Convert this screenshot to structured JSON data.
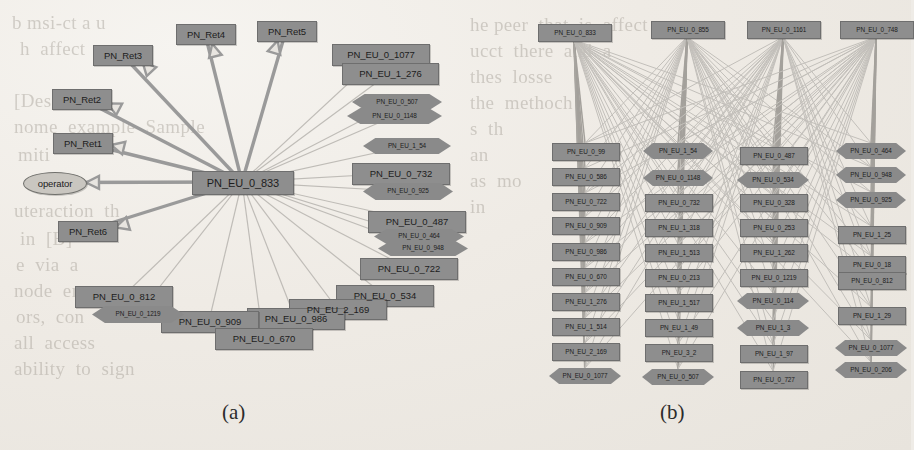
{
  "figure": {
    "type": "two-panel-graph-figure",
    "captions": [
      {
        "id": "cap-a",
        "label": "(a)",
        "x": 222,
        "y": 400
      },
      {
        "id": "cap-b",
        "label": "(b)",
        "x": 660,
        "y": 400
      }
    ]
  },
  "panel_a": {
    "name": "panel-a-star-graph",
    "caption": "(a)",
    "hub": {
      "label": "PN_EU_0_833",
      "shape": "box",
      "x": 192,
      "y": 171,
      "w": 100,
      "h": 22
    },
    "nodes": [
      {
        "label": "PN_Ret4",
        "shape": "box",
        "x": 176,
        "y": 24,
        "w": 58,
        "h": 19,
        "size": "mid"
      },
      {
        "label": "PN_Ret5",
        "shape": "box",
        "x": 257,
        "y": 21,
        "w": 58,
        "h": 19,
        "size": "mid"
      },
      {
        "label": "PN_Ret3",
        "shape": "box",
        "x": 93,
        "y": 45,
        "w": 58,
        "h": 19,
        "size": "mid"
      },
      {
        "label": "PN_Ret2",
        "shape": "box",
        "x": 52,
        "y": 89,
        "w": 58,
        "h": 19,
        "size": "mid"
      },
      {
        "label": "PN_Ret1",
        "shape": "box",
        "x": 53,
        "y": 133,
        "w": 58,
        "h": 19,
        "size": "mid"
      },
      {
        "label": "PN_Ret6",
        "shape": "box",
        "x": 58,
        "y": 221,
        "w": 58,
        "h": 19,
        "size": "mid"
      },
      {
        "label": "operator",
        "shape": "ellipse",
        "x": 23,
        "y": 172,
        "w": 62,
        "h": 21,
        "size": "mid"
      },
      {
        "label": "PN_EU_0_1077",
        "shape": "box-stack",
        "x": 332,
        "y": 44,
        "w": 96,
        "h": 20,
        "size": "mid"
      },
      {
        "label": "PN_EU_1_276",
        "shape": "box",
        "x": 342,
        "y": 63,
        "w": 95,
        "h": 20,
        "size": "mid"
      },
      {
        "label": "PN_EU_0_507",
        "shape": "diamond",
        "x": 352,
        "y": 94,
        "w": 90,
        "h": 16,
        "size": "tiny"
      },
      {
        "label": "PN_EU_0_1148",
        "shape": "diamond",
        "x": 347,
        "y": 108,
        "w": 95,
        "h": 16,
        "size": "tiny"
      },
      {
        "label": "PN_EU_1_54",
        "shape": "diamond",
        "x": 363,
        "y": 138,
        "w": 88,
        "h": 16,
        "size": "tiny"
      },
      {
        "label": "PN_EU_0_732",
        "shape": "box",
        "x": 352,
        "y": 163,
        "w": 96,
        "h": 20,
        "size": "mid"
      },
      {
        "label": "PN_EU_0_925",
        "shape": "diamond",
        "x": 363,
        "y": 183,
        "w": 90,
        "h": 17,
        "size": "tiny"
      },
      {
        "label": "PN_EU_0_487",
        "shape": "box",
        "x": 368,
        "y": 211,
        "w": 96,
        "h": 20,
        "size": "mid"
      },
      {
        "label": "PN_EU_0_464",
        "shape": "diamond",
        "x": 374,
        "y": 229,
        "w": 90,
        "h": 15,
        "size": "tiny"
      },
      {
        "label": "PN_EU_0_948",
        "shape": "diamond",
        "x": 378,
        "y": 241,
        "w": 90,
        "h": 15,
        "size": "tiny"
      },
      {
        "label": "PN_EU_0_722",
        "shape": "box",
        "x": 360,
        "y": 258,
        "w": 96,
        "h": 20,
        "size": "mid"
      },
      {
        "label": "PN_EU_0_534",
        "shape": "box",
        "x": 336,
        "y": 285,
        "w": 96,
        "h": 20,
        "size": "mid"
      },
      {
        "label": "PN_EU_2_169",
        "shape": "box",
        "x": 289,
        "y": 299,
        "w": 96,
        "h": 19,
        "size": "mid"
      },
      {
        "label": "PN_EU_0_986",
        "shape": "box",
        "x": 247,
        "y": 308,
        "w": 96,
        "h": 20,
        "size": "mid"
      },
      {
        "label": "PN_EU_0_909",
        "shape": "box",
        "x": 161,
        "y": 311,
        "w": 96,
        "h": 20,
        "size": "mid"
      },
      {
        "label": "PN_EU_0_670",
        "shape": "box",
        "x": 215,
        "y": 328,
        "w": 96,
        "h": 20,
        "size": "mid"
      },
      {
        "label": "PN_EU_0_812",
        "shape": "box",
        "x": 75,
        "y": 286,
        "w": 96,
        "h": 20,
        "size": "mid"
      },
      {
        "label": "PN_EU_0_1219",
        "shape": "diamond",
        "x": 92,
        "y": 306,
        "w": 92,
        "h": 17,
        "size": "tiny"
      }
    ],
    "edges_note": "star topology: hub PN_EU_0_833 connects to every other node; arrows point outward to PN_Ret1-6 and operator"
  },
  "panel_b": {
    "name": "panel-b-bipartite-graph",
    "caption": "(b)",
    "top_nodes": [
      {
        "label": "PN_EU_0_833",
        "x": 538,
        "y": 24,
        "w": 72,
        "h": 16
      },
      {
        "label": "PN_EU_0_855",
        "x": 651,
        "y": 21,
        "w": 72,
        "h": 16
      },
      {
        "label": "PN_EU_0_1161",
        "x": 747,
        "y": 21,
        "w": 72,
        "h": 16
      },
      {
        "label": "PN_EU_0_748",
        "x": 840,
        "y": 21,
        "w": 72,
        "h": 16
      }
    ],
    "columns": [
      {
        "name": "column-1",
        "x": 552,
        "items": [
          {
            "label": "PN_EU_0_99",
            "shape": "box",
            "y": 143,
            "w": 66,
            "h": 16
          },
          {
            "label": "PN_EU_0_586",
            "shape": "box",
            "y": 168,
            "w": 66,
            "h": 16
          },
          {
            "label": "PN_EU_0_722",
            "shape": "box",
            "y": 193,
            "w": 66,
            "h": 16
          },
          {
            "label": "PN_EU_0_909",
            "shape": "box",
            "y": 217,
            "w": 66,
            "h": 16
          },
          {
            "label": "PN_EU_0_986",
            "shape": "box",
            "y": 243,
            "w": 66,
            "h": 16
          },
          {
            "label": "PN_EU_0_670",
            "shape": "box",
            "y": 268,
            "w": 66,
            "h": 16
          },
          {
            "label": "PN_EU_1_276",
            "shape": "box",
            "y": 293,
            "w": 66,
            "h": 16
          },
          {
            "label": "PN_EU_1_514",
            "shape": "box",
            "y": 318,
            "w": 66,
            "h": 16
          },
          {
            "label": "PN_EU_2_169",
            "shape": "box",
            "y": 343,
            "w": 66,
            "h": 16
          },
          {
            "label": "PN_EU_0_1077",
            "shape": "diamond",
            "y": 368,
            "w": 72,
            "h": 16
          }
        ]
      },
      {
        "name": "column-2",
        "x": 645,
        "items": [
          {
            "label": "PN_EU_1_54",
            "shape": "diamond",
            "y": 143,
            "w": 70,
            "h": 16
          },
          {
            "label": "PN_EU_0_1148",
            "shape": "diamond",
            "y": 170,
            "w": 70,
            "h": 16
          },
          {
            "label": "PN_EU_0_732",
            "shape": "box",
            "y": 194,
            "w": 66,
            "h": 16
          },
          {
            "label": "PN_EU_1_318",
            "shape": "box",
            "y": 219,
            "w": 66,
            "h": 16
          },
          {
            "label": "PN_EU_1_513",
            "shape": "box",
            "y": 244,
            "w": 66,
            "h": 16
          },
          {
            "label": "PN_EU_0_213",
            "shape": "box",
            "y": 269,
            "w": 66,
            "h": 16
          },
          {
            "label": "PN_EU_1_517",
            "shape": "box",
            "y": 294,
            "w": 66,
            "h": 16
          },
          {
            "label": "PN_EU_1_49",
            "shape": "box",
            "y": 319,
            "w": 66,
            "h": 16
          },
          {
            "label": "PN_EU_3_2",
            "shape": "box",
            "y": 344,
            "w": 66,
            "h": 16
          },
          {
            "label": "PN_EU_0_507",
            "shape": "diamond",
            "y": 369,
            "w": 72,
            "h": 16
          }
        ]
      },
      {
        "name": "column-3",
        "x": 740,
        "items": [
          {
            "label": "PN_EU_0_487",
            "shape": "box",
            "y": 147,
            "w": 66,
            "h": 16
          },
          {
            "label": "PN_EU_0_534",
            "shape": "diamond",
            "y": 172,
            "w": 72,
            "h": 16
          },
          {
            "label": "PN_EU_0_328",
            "shape": "box",
            "y": 194,
            "w": 66,
            "h": 16
          },
          {
            "label": "PN_EU_0_253",
            "shape": "box",
            "y": 219,
            "w": 66,
            "h": 16
          },
          {
            "label": "PN_EU_1_262",
            "shape": "box",
            "y": 244,
            "w": 66,
            "h": 16
          },
          {
            "label": "PN_EU_0_1219",
            "shape": "box",
            "y": 269,
            "w": 66,
            "h": 16
          },
          {
            "label": "PN_EU_0_114",
            "shape": "diamond",
            "y": 293,
            "w": 72,
            "h": 16
          },
          {
            "label": "PN_EU_1_3",
            "shape": "diamond",
            "y": 320,
            "w": 72,
            "h": 16
          },
          {
            "label": "PN_EU_1_97",
            "shape": "box",
            "y": 345,
            "w": 66,
            "h": 16
          },
          {
            "label": "PN_EU_0_727",
            "shape": "box",
            "y": 371,
            "w": 66,
            "h": 16
          }
        ]
      },
      {
        "name": "column-4",
        "x": 838,
        "items": [
          {
            "label": "PN_EU_0_464",
            "shape": "diamond",
            "y": 143,
            "w": 70,
            "h": 16
          },
          {
            "label": "PN_EU_0_948",
            "shape": "diamond",
            "y": 167,
            "w": 70,
            "h": 16
          },
          {
            "label": "PN_EU_0_925",
            "shape": "diamond",
            "y": 192,
            "w": 70,
            "h": 16
          },
          {
            "label": "PN_EU_1_25",
            "shape": "box",
            "y": 226,
            "w": 66,
            "h": 16
          },
          {
            "label": "PN_EU_0_18",
            "shape": "box",
            "y": 256,
            "w": 66,
            "h": 16
          },
          {
            "label": "PN_EU_0_812",
            "shape": "box",
            "y": 272,
            "w": 66,
            "h": 16
          },
          {
            "label": "PN_EU_1_29",
            "shape": "box",
            "y": 307,
            "w": 66,
            "h": 16
          },
          {
            "label": "PN_EU_0_1077",
            "shape": "diamond",
            "y": 340,
            "w": 72,
            "h": 16
          },
          {
            "label": "PN_EU_0_206",
            "shape": "diamond",
            "y": 362,
            "w": 72,
            "h": 16
          }
        ]
      }
    ],
    "edges_note": "dense many-to-many bipartite fan from the 4 top nodes down to all column nodes"
  },
  "bleed_text": {
    "name": "reverse-page-bleed-through",
    "lines": [
      {
        "t": "b msi-ct a u",
        "x": 12,
        "y": 8
      },
      {
        "t": "h  affect  a",
        "x": 20,
        "y": 34
      },
      {
        "t": "[Desci] It",
        "x": 14,
        "y": 86
      },
      {
        "t": "nome  example  Sample",
        "x": 14,
        "y": 112
      },
      {
        "t": "miti",
        "x": 18,
        "y": 140
      },
      {
        "t": "uteraction  th",
        "x": 14,
        "y": 196
      },
      {
        "t": "in  [B]",
        "x": 20,
        "y": 224
      },
      {
        "t": "e  via  a",
        "x": 16,
        "y": 250
      },
      {
        "t": "node  en",
        "x": 14,
        "y": 276
      },
      {
        "t": "ors,  con",
        "x": 16,
        "y": 302
      },
      {
        "t": "all  access",
        "x": 14,
        "y": 328
      },
      {
        "t": "ability  to  sign",
        "x": 14,
        "y": 354
      },
      {
        "t": "he peer  that  is  affect  u",
        "x": 470,
        "y": 10
      },
      {
        "t": "ucct  there  and  a",
        "x": 470,
        "y": 36
      },
      {
        "t": "thes  losse",
        "x": 470,
        "y": 62
      },
      {
        "t": "the  methoch",
        "x": 470,
        "y": 88
      },
      {
        "t": "s  th",
        "x": 470,
        "y": 114
      },
      {
        "t": "an",
        "x": 470,
        "y": 140
      },
      {
        "t": "as  mo",
        "x": 470,
        "y": 166
      },
      {
        "t": "in",
        "x": 470,
        "y": 192
      }
    ]
  },
  "palette": {
    "paper": "#efece7",
    "node_fill": "#8e8e8e",
    "node_border": "#6e6e6e",
    "node_text": "#1d1d1d",
    "edge_dark": "#8a8a8a",
    "edge_light": "#b9b6b1",
    "caption_text": "#2b2b2b"
  }
}
